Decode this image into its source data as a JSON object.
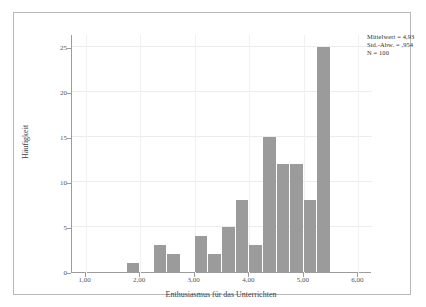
{
  "chart_data": {
    "type": "bar",
    "title": "",
    "subtitle": "",
    "xlabel": "Enthusiasmus für das Unterrichten",
    "ylabel": "Häufigkeit",
    "xlim": [
      0.75,
      6.25
    ],
    "ylim": [
      0,
      26.5
    ],
    "grid": true,
    "legend_position": "top-right",
    "bin_width": 0.25,
    "x_tick_labels": [
      "1,00",
      "2,00",
      "3,00",
      "4,00",
      "5,00",
      "6,00"
    ],
    "x_tick_values": [
      1,
      2,
      3,
      4,
      5,
      6
    ],
    "y_tick_labels": [
      "0",
      "5",
      "10",
      "15",
      "20",
      "25"
    ],
    "y_tick_values": [
      0,
      5,
      10,
      15,
      20,
      25
    ],
    "bars": [
      {
        "bin_start": 1.75,
        "bin_end": 2.0,
        "center": 1.875,
        "value": 1
      },
      {
        "bin_start": 2.25,
        "bin_end": 2.5,
        "center": 2.375,
        "value": 3
      },
      {
        "bin_start": 2.5,
        "bin_end": 2.75,
        "center": 2.625,
        "value": 2
      },
      {
        "bin_start": 3.0,
        "bin_end": 3.25,
        "center": 3.125,
        "value": 4
      },
      {
        "bin_start": 3.25,
        "bin_end": 3.5,
        "center": 3.375,
        "value": 2
      },
      {
        "bin_start": 3.5,
        "bin_end": 3.75,
        "center": 3.625,
        "value": 5
      },
      {
        "bin_start": 3.75,
        "bin_end": 4.0,
        "center": 3.875,
        "value": 8
      },
      {
        "bin_start": 4.0,
        "bin_end": 4.25,
        "center": 4.125,
        "value": 3
      },
      {
        "bin_start": 4.25,
        "bin_end": 4.5,
        "center": 4.375,
        "value": 15
      },
      {
        "bin_start": 4.5,
        "bin_end": 4.75,
        "center": 4.625,
        "value": 12
      },
      {
        "bin_start": 4.75,
        "bin_end": 5.0,
        "center": 4.875,
        "value": 12
      },
      {
        "bin_start": 5.0,
        "bin_end": 5.25,
        "center": 5.125,
        "value": 8
      },
      {
        "bin_start": 5.25,
        "bin_end": 5.5,
        "center": 5.375,
        "value": 25
      }
    ],
    "categories": [
      "1,88",
      "2,38",
      "2,63",
      "3,13",
      "3,38",
      "3,63",
      "3,88",
      "4,13",
      "4,38",
      "4,63",
      "4,88",
      "5,13",
      "5,38"
    ],
    "values": [
      1,
      3,
      2,
      4,
      2,
      5,
      8,
      3,
      15,
      12,
      12,
      8,
      25
    ],
    "bar_color": "#9b9b9b",
    "background_color": "#ffffff",
    "gridline_color": "#ececec",
    "axis_color": "#9c9c9c"
  },
  "stats": {
    "mean_label": "Mittelwert = 4,93",
    "sd_label": "Std.-Abw. = ,954",
    "n_label": "N = 100"
  }
}
